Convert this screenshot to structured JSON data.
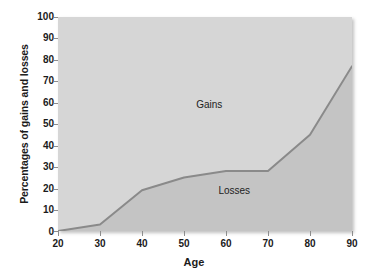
{
  "chart_data": {
    "type": "area",
    "title": "",
    "subtitle": "",
    "xlabel": "Age",
    "ylabel": "Percentages of gains and losses",
    "xlim": [
      20,
      90
    ],
    "ylim": [
      0,
      100
    ],
    "xticks": [
      "20",
      "30",
      "40",
      "50",
      "60",
      "70",
      "80",
      "90"
    ],
    "yticks": [
      "0",
      "10",
      "20",
      "30",
      "40",
      "50",
      "60",
      "70",
      "80",
      "90",
      "100"
    ],
    "grid": false,
    "legend_position": "inline-annotations",
    "x": [
      20,
      30,
      40,
      50,
      60,
      70,
      80,
      90
    ],
    "series": [
      {
        "name": "Losses",
        "values": [
          0,
          3,
          19,
          25,
          28,
          28,
          45,
          77
        ],
        "fill_color": "#c4c4c4",
        "line_color": "#8a8a8a"
      },
      {
        "name": "Gains",
        "values": [
          100,
          97,
          81,
          75,
          72,
          72,
          55,
          23
        ],
        "fill_color": "#d6d6d6"
      }
    ],
    "annotations": [
      {
        "text": "Gains",
        "x": 56,
        "y": 59
      },
      {
        "text": "Losses",
        "x": 62,
        "y": 19
      }
    ],
    "colors": {
      "gains_area": "#d6d6d6",
      "losses_area": "#c4c4c4",
      "curve": "#8a8a8a",
      "axis_text": "#1b1b1b",
      "tick_mark": "#8d8d8d",
      "background": "#ffffff"
    }
  }
}
